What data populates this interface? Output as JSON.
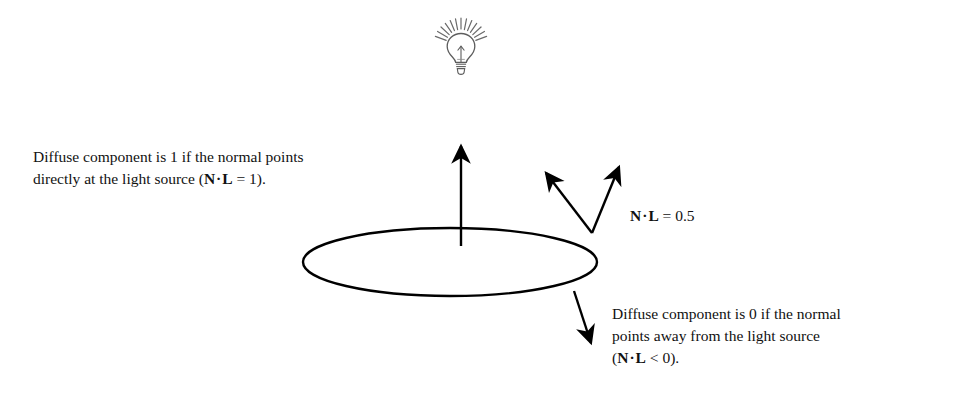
{
  "figure": {
    "background_color": "#ffffff",
    "ink_color": "#000000",
    "bulb_color": "#555555"
  },
  "light_source": {
    "icon_name": "light-bulb-icon",
    "rays_count": 13
  },
  "surface": {
    "name": "ellipse-surface",
    "center_x": 450,
    "center_y": 262,
    "radius_x": 147,
    "radius_y": 34
  },
  "notes": {
    "left": {
      "line1": "Diffuse component is 1 if the normal points",
      "line2_prefix": "directly at the light source (",
      "line2_n": "N",
      "line2_dot": "·",
      "line2_l": "L",
      "line2_suffix": " = 1)."
    },
    "right": {
      "line1": "Diffuse component is 0 if the normal",
      "line2": "points away from the light source",
      "line3_prefix": "(",
      "line3_n": "N",
      "line3_dot": "·",
      "line3_l": "L",
      "line3_suffix": " <  0)."
    }
  },
  "label_ndotl": {
    "n": "N",
    "dot": "·",
    "l": "L",
    "value": " = 0.5"
  },
  "arrows": [
    {
      "name": "normal-arrow-up",
      "from": [
        461,
        245
      ],
      "to": [
        461,
        143
      ],
      "meaning": "normal pointing directly at light source, N dot L = 1"
    },
    {
      "name": "normal-arrow-right-tilted",
      "from": [
        592,
        233
      ],
      "to": [
        621,
        162
      ],
      "meaning": "surface normal at grazing point"
    },
    {
      "name": "light-direction-arrow",
      "from": [
        592,
        233
      ],
      "to": [
        543,
        169
      ],
      "meaning": "direction to light source, N dot L = 0.5"
    },
    {
      "name": "normal-arrow-down",
      "from": [
        574,
        291
      ],
      "to": [
        593,
        348
      ],
      "meaning": "normal pointing away from light source, N dot L < 0"
    }
  ]
}
